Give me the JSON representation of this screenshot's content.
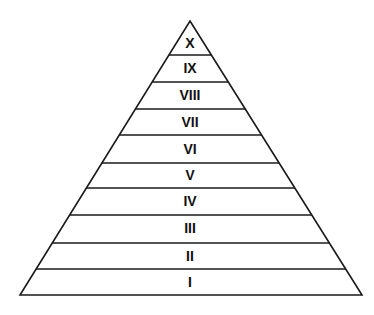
{
  "figure": {
    "name": "ten-tier-pyramid",
    "title": "",
    "background_color": "#ffffff",
    "line_color": "#1a1a1a",
    "label_color": "#111111",
    "line_width": 1.6
  },
  "geometry": {
    "apex": {
      "x": 190,
      "y": 21
    },
    "base_left": {
      "x": 20,
      "y": 295
    },
    "base_right": {
      "x": 362,
      "y": 295
    },
    "divider_y": [
      55,
      82,
      109,
      135,
      163,
      188,
      215,
      243,
      269
    ],
    "center_x": 190
  },
  "tiers": [
    {
      "label": "X",
      "index": 10,
      "top_y": 21,
      "bottom_y": 55,
      "label_y": 44
    },
    {
      "label": "IX",
      "index": 9,
      "top_y": 55,
      "bottom_y": 82,
      "label_y": 69
    },
    {
      "label": "VIII",
      "index": 8,
      "top_y": 82,
      "bottom_y": 109,
      "label_y": 96
    },
    {
      "label": "VII",
      "index": 7,
      "top_y": 109,
      "bottom_y": 135,
      "label_y": 123
    },
    {
      "label": "VI",
      "index": 6,
      "top_y": 135,
      "bottom_y": 163,
      "label_y": 150
    },
    {
      "label": "V",
      "index": 5,
      "top_y": 163,
      "bottom_y": 188,
      "label_y": 176
    },
    {
      "label": "IV",
      "index": 4,
      "top_y": 188,
      "bottom_y": 215,
      "label_y": 202
    },
    {
      "label": "III",
      "index": 3,
      "top_y": 215,
      "bottom_y": 243,
      "label_y": 229
    },
    {
      "label": "II",
      "index": 2,
      "top_y": 243,
      "bottom_y": 269,
      "label_y": 257
    },
    {
      "label": "I",
      "index": 1,
      "top_y": 269,
      "bottom_y": 295,
      "label_y": 283
    }
  ]
}
